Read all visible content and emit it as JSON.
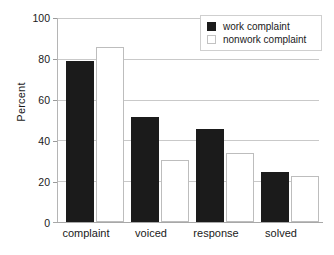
{
  "chart_data": {
    "type": "bar",
    "title": "",
    "subtitle": "",
    "xlabel": "",
    "ylabel": "Percent",
    "categories": [
      "complaint",
      "voiced",
      "response",
      "solved"
    ],
    "series": [
      {
        "name": "work complaint",
        "color": "#1b1b1b",
        "fill": "solid",
        "values": [
          79,
          51.5,
          45.5,
          24.5
        ]
      },
      {
        "name": "nonwork complaint",
        "color": "#ffffff",
        "fill": "hollow",
        "values": [
          86,
          30.5,
          34,
          22.5
        ]
      }
    ],
    "ylim": [
      0,
      100
    ],
    "yticks": [
      0,
      20,
      40,
      60,
      80,
      100
    ],
    "ytick_labels": [
      "0",
      "20",
      "40",
      "60",
      "80",
      "100"
    ],
    "grid": true,
    "grid_axis": "y",
    "legend_position": "top-right",
    "legend_entries": [
      "work complaint",
      "nonwork complaint"
    ]
  },
  "axes": {
    "y_title": "Percent",
    "ticks": [
      {
        "label": "100",
        "value": 100
      },
      {
        "label": "80",
        "value": 80
      },
      {
        "label": "60",
        "value": 60
      },
      {
        "label": "40",
        "value": 40
      },
      {
        "label": "20",
        "value": 20
      },
      {
        "label": "0",
        "value": 0
      }
    ]
  },
  "x_axis": {
    "labels": [
      "complaint",
      "voiced",
      "response",
      "solved"
    ]
  },
  "legend": {
    "items": [
      {
        "label": "work complaint",
        "swatch": "filled-square-icon"
      },
      {
        "label": "nonwork complaint",
        "swatch": "hollow-square-icon"
      }
    ]
  }
}
